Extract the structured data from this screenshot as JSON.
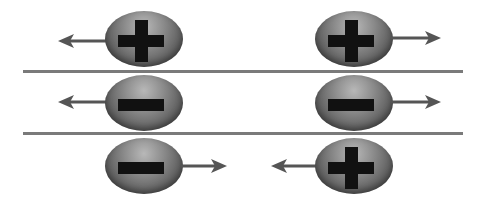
{
  "diagram": {
    "colors": {
      "particle": "#6e6e6e",
      "sign": "#111111",
      "arrow": "#555555",
      "divider": "#7a7a7a"
    },
    "rows": [
      {
        "name": "positive-positive",
        "left": {
          "charge": "+",
          "direction": "left"
        },
        "right": {
          "charge": "+",
          "direction": "right"
        },
        "interaction": "repel"
      },
      {
        "name": "negative-negative",
        "left": {
          "charge": "-",
          "direction": "left"
        },
        "right": {
          "charge": "-",
          "direction": "right"
        },
        "interaction": "repel"
      },
      {
        "name": "negative-positive",
        "left": {
          "charge": "-",
          "direction": "right"
        },
        "right": {
          "charge": "+",
          "direction": "left"
        },
        "interaction": "attract"
      }
    ]
  }
}
